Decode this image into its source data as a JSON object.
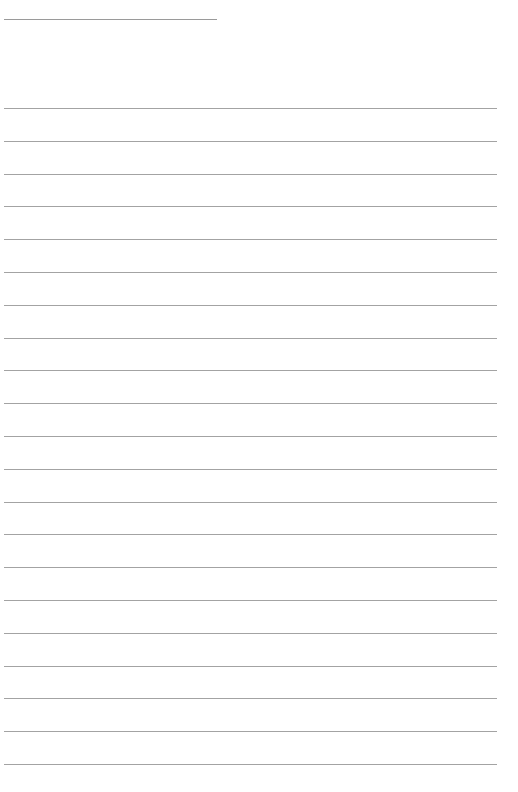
{
  "document": {
    "type": "blank lined sheet",
    "header_line": {
      "present": true,
      "text": ""
    },
    "ruled_lines": {
      "count": 21,
      "filled_text": []
    },
    "colors": {
      "paper": "#ffffff",
      "line": "#a3a3a3"
    }
  }
}
